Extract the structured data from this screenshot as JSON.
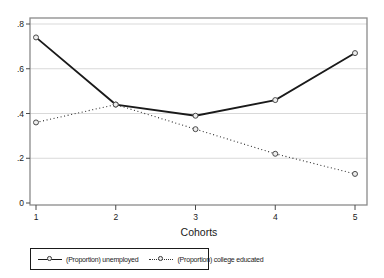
{
  "figure": {
    "background": "#ffffff"
  },
  "chart_data": {
    "type": "line",
    "x": [
      1,
      2,
      3,
      4,
      5
    ],
    "categories": [
      "1",
      "2",
      "3",
      "4",
      "5"
    ],
    "series": [
      {
        "name": "(Proportion) unemployed",
        "style": "solid",
        "marker": "circle",
        "color": "#1a1a1a",
        "values": [
          0.74,
          0.44,
          0.39,
          0.46,
          0.67
        ]
      },
      {
        "name": "(Proportion) college educated",
        "style": "dotted",
        "marker": "circle",
        "color": "#2e2e2e",
        "values": [
          0.36,
          0.44,
          0.33,
          0.22,
          0.13
        ]
      }
    ],
    "title": "",
    "xlabel": "Cohorts",
    "ylabel": "",
    "xlim": [
      1,
      5
    ],
    "ylim": [
      0,
      0.8
    ],
    "yticks": [
      0,
      0.2,
      0.4,
      0.6,
      0.8
    ],
    "ytick_labels": [
      "0",
      ".2",
      ".4",
      ".6",
      ".8"
    ],
    "grid": true,
    "legend_position": "bottom-left",
    "colors": {
      "grid": "#d9d9d9",
      "frame": "#8a8a8a",
      "tick": "#4a4a4a",
      "text": "#1a1a1a",
      "marker_fill": "#ededed",
      "marker_stroke": "#4a4a4a"
    }
  }
}
